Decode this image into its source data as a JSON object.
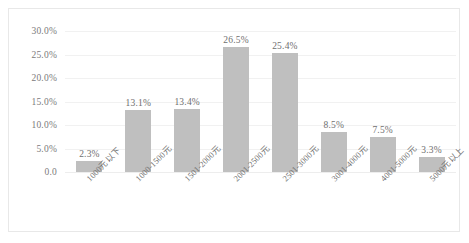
{
  "chart_data": {
    "type": "bar",
    "title": "",
    "subtitle": "",
    "xlabel": "",
    "ylabel": "",
    "ylim": [
      0,
      30
    ],
    "grid": true,
    "legend": false,
    "orientation": "vertical",
    "bar_color": "#BFBFBF",
    "gridline_color": "#F1F1F1",
    "label_color": "#6F6F6F",
    "categories": [
      "1000元以下",
      "1000-1500元",
      "1501-2000元",
      "2001-2500元",
      "2501-3000元",
      "3001-4000元",
      "4001-5000元",
      "5000元以上"
    ],
    "values": [
      2.3,
      13.1,
      13.4,
      26.5,
      25.4,
      8.5,
      7.5,
      3.3
    ],
    "value_labels": [
      "2.3%",
      "13.1%",
      "13.4%",
      "26.5%",
      "25.4%",
      "8.5%",
      "7.5%",
      "3.3%"
    ],
    "yticks": [
      0,
      5,
      10,
      15,
      20,
      25,
      30
    ],
    "ytick_labels": [
      "0.0",
      "5.0%",
      "10.0%",
      "15.0%",
      "20.0%",
      "25.0%",
      "30.0%"
    ]
  }
}
